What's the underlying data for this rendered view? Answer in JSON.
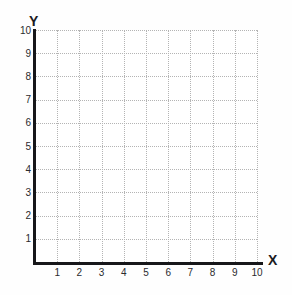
{
  "chart_data": {
    "type": "scatter",
    "title": "",
    "subtitle": "",
    "xlabel": "X",
    "ylabel": "Y",
    "xlim": [
      0,
      10
    ],
    "ylim": [
      0,
      10
    ],
    "x_ticks": [
      1,
      2,
      3,
      4,
      5,
      6,
      7,
      8,
      9,
      10
    ],
    "y_ticks": [
      1,
      2,
      3,
      4,
      5,
      6,
      7,
      8,
      9,
      10
    ],
    "x_tick_labels": [
      "1",
      "2",
      "3",
      "4",
      "5",
      "6",
      "7",
      "8",
      "9",
      "10"
    ],
    "y_tick_labels": [
      "1",
      "2",
      "3",
      "4",
      "5",
      "6",
      "7",
      "8",
      "9",
      "10"
    ],
    "grid": true,
    "grid_style": "dotted",
    "grid_color": "#b4b4b4",
    "axis_color": "#17171a",
    "background_color": "#ffffff",
    "legend": [],
    "legend_position": "none",
    "series": [],
    "annotations": []
  },
  "axes": {
    "y_label": "Y",
    "x_label": "X"
  },
  "colors": {
    "axis": "#17171a",
    "grid": "#b4b4b4",
    "text": "#2b2b2e",
    "background": "#ffffff"
  }
}
